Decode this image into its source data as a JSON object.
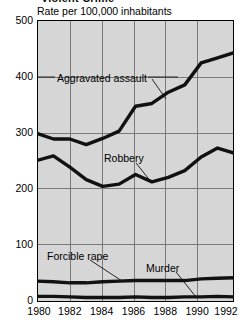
{
  "figure": {
    "title_truncated": "Violent Crime",
    "axis_caption": "Rate per 100,000 inhabitants"
  },
  "annotations": {
    "aggravated_assault": "Aggravated assault",
    "robbery": "Robbery",
    "forcible_rape": "Forcible rape",
    "murder": "Murder"
  },
  "chart_data": {
    "type": "line",
    "title": "Violent Crime",
    "subtitle": "Rate per 100,000 inhabitants",
    "xlabel": "",
    "ylabel": "Rate per 100,000 inhabitants",
    "x": [
      1980,
      1981,
      1982,
      1983,
      1984,
      1985,
      1986,
      1987,
      1988,
      1989,
      1990,
      1991,
      1992
    ],
    "xlim": [
      1980,
      1992
    ],
    "ylim": [
      0,
      500
    ],
    "xticks": [
      1980,
      1982,
      1984,
      1986,
      1988,
      1990,
      1992
    ],
    "xticklabels": [
      "1980",
      "1982",
      "1984",
      "1986",
      "1988",
      "1990",
      "1992"
    ],
    "yticks": [
      0,
      100,
      200,
      300,
      400,
      500
    ],
    "yticklabels": [
      "0",
      "100",
      "200",
      "300",
      "400",
      "500"
    ],
    "grid": true,
    "legend": "inline-annotations",
    "series": [
      {
        "name": "Aggravated assault",
        "values": [
          299,
          289,
          289,
          279,
          290,
          303,
          347,
          352,
          372,
          385,
          424,
          433,
          442
        ]
      },
      {
        "name": "Robbery",
        "values": [
          251,
          259,
          239,
          217,
          205,
          209,
          226,
          213,
          221,
          233,
          257,
          273,
          264
        ]
      },
      {
        "name": "Forcible rape",
        "values": [
          37,
          36,
          34,
          34,
          36,
          37,
          38,
          38,
          38,
          38,
          41,
          42,
          43
        ]
      },
      {
        "name": "Murder",
        "values": [
          10,
          10,
          9,
          8,
          8,
          8,
          9,
          8,
          8,
          9,
          9,
          10,
          9
        ]
      }
    ]
  }
}
